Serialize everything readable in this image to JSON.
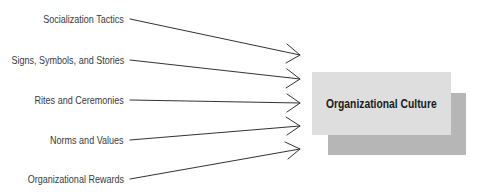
{
  "diagram": {
    "type": "many-to-one influence diagram",
    "inputs": [
      {
        "label": "Socialization Tactics",
        "y": 19,
        "arrow_tip_y": 55
      },
      {
        "label": "Signs, Symbols, and Stories",
        "y": 60,
        "arrow_tip_y": 79
      },
      {
        "label": "Rites and Ceremonies",
        "y": 100,
        "arrow_tip_y": 103
      },
      {
        "label": "Norms and Values",
        "y": 140,
        "arrow_tip_y": 126
      },
      {
        "label": "Organizational Rewards",
        "y": 179,
        "arrow_tip_y": 149
      }
    ],
    "target": {
      "label": "Organizational Culture"
    },
    "colors": {
      "front_box": "#dedede",
      "shadow_box": "#b6b6b6",
      "line": "#333333",
      "text": "#3a3a3a"
    }
  }
}
